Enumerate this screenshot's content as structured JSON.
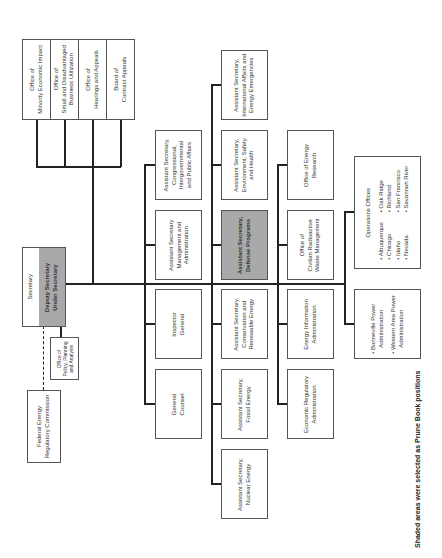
{
  "chart": {
    "orientation": "rotated-90-ccw",
    "shade_color": "#a9a9a9",
    "footer": "Shaded areas were selected as Prune Book positions",
    "top": {
      "secretary": "Secretary",
      "deputy": "Deputy Secretary",
      "under": "Under Secretary"
    },
    "staff_offices": [
      {
        "line1": "Office of",
        "line2": "Minority Economic Impact"
      },
      {
        "line1": "Office of",
        "line2": "Small and Disadvantaged",
        "line3": "Business Utilization"
      },
      {
        "line1": "Office of",
        "line2": "Hearings and Appeals"
      },
      {
        "line1": "Board of",
        "line2": "Contract Appeals"
      }
    ],
    "policy_office": {
      "line1": "Office of",
      "line2": "Policy, Planning",
      "line3": "and Analysis"
    },
    "ferc": {
      "line1": "Federal Energy",
      "line2": "Regulatory Commission"
    },
    "column1": [
      {
        "line1": "Assistant Secretary,",
        "line2": "Congressional,",
        "line3": "Intergovernmental",
        "line4": "and Public Affairs"
      },
      {
        "line1": "Assistant Secretary",
        "line2": "Management and",
        "line3": "Administration"
      },
      {
        "line1": "Inspector",
        "line2": "General"
      },
      {
        "line1": "General",
        "line2": "Counsel"
      }
    ],
    "column2": [
      {
        "line1": "Assistant Secretary,",
        "line2": "International Affairs and",
        "line3": "Energy Emergencies"
      },
      {
        "line1": "Assistant Secretary,",
        "line2": "Environment, Safety",
        "line3": "and Health"
      },
      {
        "line1": "Assistant Secretary,",
        "line2": "Defense Programs",
        "shaded": true
      },
      {
        "line1": "Assistant Secretary,",
        "line2": "Conservation and",
        "line3": "Renewable Energy"
      },
      {
        "line1": "Assistant Secretary,",
        "line2": "Fossil Energy"
      },
      {
        "line1": "Assistant Secretary,",
        "line2": "Nuclear Energy"
      }
    ],
    "column3": [
      {
        "line1": "Office of Energy",
        "line2": "Research"
      },
      {
        "line1": "Office of",
        "line2": "Civilian Radioactive",
        "line3": "Waste Management"
      },
      {
        "line1": "Energy Information",
        "line2": "Administration"
      },
      {
        "line1": "Economic Regulatory",
        "line2": "Administration"
      }
    ],
    "operations": {
      "title": "Operations Offices",
      "left": [
        "• Albuquerque",
        "• Chicago",
        "• Idaho",
        "• Nevada"
      ],
      "right": [
        "• Oak Ridge",
        "• Richland",
        "• San Francisco",
        "• Savannah River"
      ]
    },
    "power": {
      "item1_line1": "• Bonneville Power",
      "item1_line2": "Administration",
      "item2_line1": "• Western Area Power",
      "item2_line2": "Administration"
    }
  }
}
